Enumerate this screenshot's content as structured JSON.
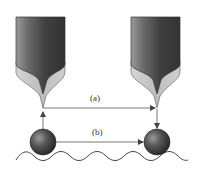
{
  "diagram": {
    "labels": {
      "a": "(a)",
      "b": "(b)"
    },
    "elements": {
      "left_tip": "probe-tip-start",
      "right_tip": "probe-tip-end",
      "left_particle": "particle-start",
      "right_particle": "particle-end",
      "surface": "wavy-surface"
    },
    "colors": {
      "tip_body_dark": "#3a3a3a",
      "tip_body_light": "#9a9a9a",
      "tip_cone_light": "#c8c8c8",
      "particle_dark": "#2e2e2e",
      "particle_light": "#8a8a8a",
      "arrow": "#555555",
      "surface_line": "#444444"
    }
  }
}
